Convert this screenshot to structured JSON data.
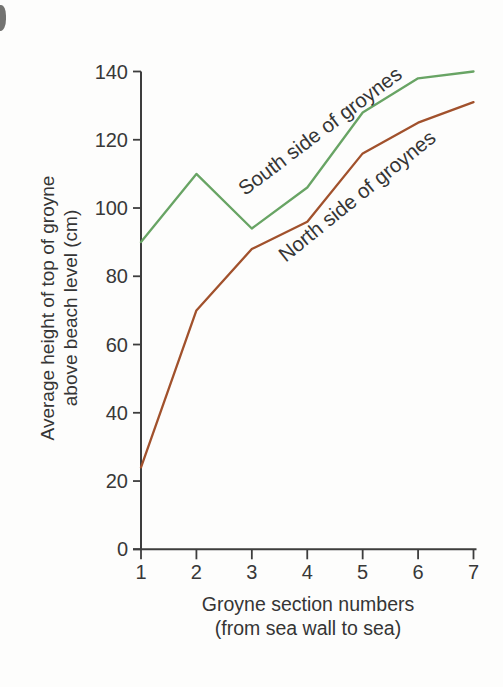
{
  "figure": {
    "background": "#fdfdfc",
    "axis_color": "#3d3d3d",
    "text_color": "#383838"
  },
  "chart_data": {
    "type": "line",
    "title": "",
    "x": [
      1,
      2,
      3,
      4,
      5,
      6,
      7
    ],
    "xticks": [
      1,
      2,
      3,
      4,
      5,
      6,
      7
    ],
    "yticks": [
      0,
      20,
      40,
      60,
      80,
      100,
      120,
      140
    ],
    "xlim": [
      1,
      7
    ],
    "ylim": [
      0,
      140
    ],
    "grid": false,
    "legend_position": "inline-rotated-labels-on-lines",
    "xlabel_line1": "Groyne section numbers",
    "xlabel_line2": "(from sea wall to sea)",
    "ylabel_line1": "Average height of top of groyne",
    "ylabel_line2": "above beach level (cm)",
    "series": [
      {
        "name": "South side of groynes",
        "color": "#68a464",
        "values": [
          90,
          110,
          94,
          106,
          128,
          138,
          140
        ]
      },
      {
        "name": "North side of groynes",
        "color": "#a1512c",
        "values": [
          24,
          70,
          88,
          96,
          116,
          125,
          131
        ]
      }
    ]
  }
}
